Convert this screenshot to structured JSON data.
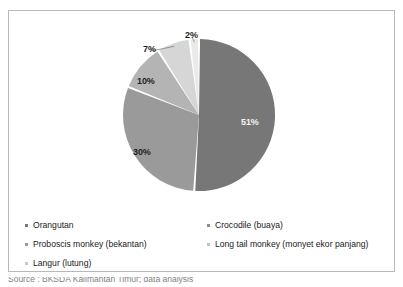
{
  "chart_data": {
    "type": "pie",
    "title": "",
    "categories": [
      "Orangutan",
      "Crocodile (buaya)",
      "Proboscis monkey (bekantan)",
      "Long tail monkey (monyet ekor panjang)",
      "Langur (lutung)"
    ],
    "values": [
      51,
      30,
      10,
      7,
      2
    ],
    "value_labels": [
      "51%",
      "30%",
      "10%",
      "7%",
      "2%"
    ],
    "unit": "percent",
    "start_angle_deg": 0,
    "direction": "clockwise",
    "legend_position": "bottom",
    "grid": false,
    "colors": [
      "#777777",
      "#9a9a9a",
      "#b4b4b4",
      "#d6d6d6",
      "#eaeaea"
    ],
    "slice_gap_color": "#ffffff"
  },
  "figure": {
    "border_color": "#b9b9b9",
    "background": "#ffffff"
  },
  "slices": [
    {
      "name": "orangutan",
      "label": "51%",
      "value": 51,
      "color": "#777777",
      "label_on_dark": true,
      "label_x": 243,
      "label_y": 112,
      "leader": false
    },
    {
      "name": "crocodile",
      "label": "30%",
      "value": 30,
      "color": "#9a9a9a",
      "label_on_dark": false,
      "label_x": 134,
      "label_y": 142,
      "leader": false
    },
    {
      "name": "proboscis-monkey",
      "label": "10%",
      "value": 10,
      "color": "#b4b4b4",
      "label_on_dark": false,
      "label_x": 138,
      "label_y": 71,
      "leader": false
    },
    {
      "name": "long-tail-monkey",
      "label": "7%",
      "value": 7,
      "color": "#d6d6d6",
      "label_on_dark": false,
      "label_x": 142,
      "label_y": 40,
      "leader": true
    },
    {
      "name": "langur",
      "label": "2%",
      "value": 2,
      "color": "#eaeaea",
      "label_on_dark": false,
      "label_x": 183,
      "label_y": 26,
      "leader": true
    }
  ],
  "legend": {
    "left_column": [
      {
        "marker_color": "#777777",
        "label": "Orangutan"
      },
      {
        "marker_color": "#9a9a9a",
        "label": "Proboscis monkey (bekantan)"
      },
      {
        "marker_color": "#c9c9c9",
        "label": "Langur (lutung)"
      }
    ],
    "right_column": [
      {
        "marker_color": "#8d8d8d",
        "label": "Crocodile (buaya)"
      },
      {
        "marker_color": "#c2c2c2",
        "label": "Long tail monkey (monyet ekor panjang)"
      }
    ]
  },
  "caption": {
    "text": "Source : BKSDA Kalimantan Timur; data analysis"
  }
}
